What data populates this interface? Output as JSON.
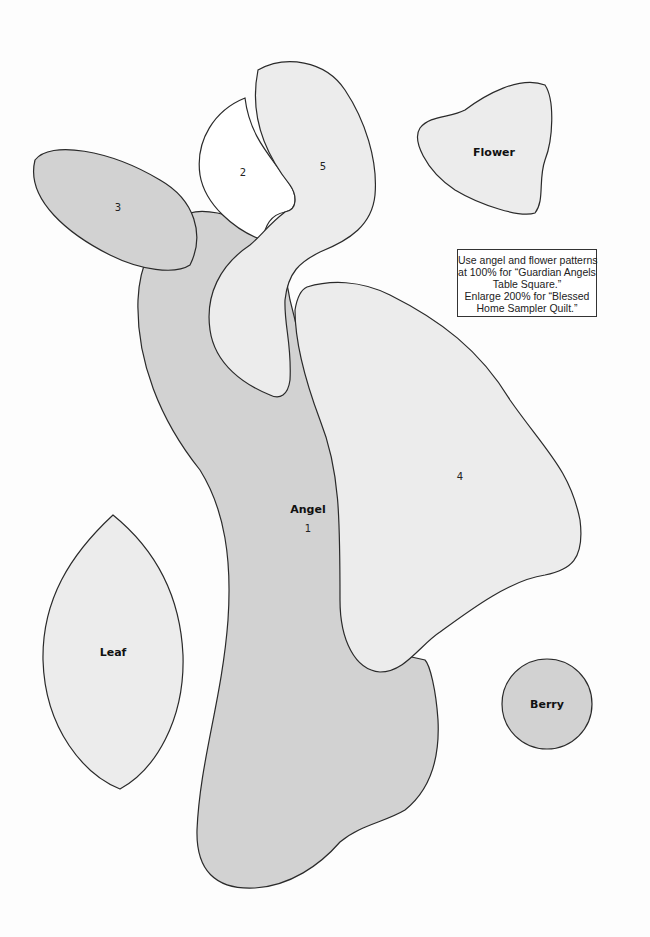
{
  "document": {
    "type": "quilt applique pattern sheet",
    "colors": {
      "background": "#fdfdfd",
      "dark_fill": "#d2d2d2",
      "light_fill": "#ececec",
      "white_fill": "#ffffff",
      "outline": "#2a2a2a"
    },
    "pieces": {
      "angel": {
        "label": "Angel",
        "number": "1"
      },
      "head": {
        "number": "2"
      },
      "wing_left": {
        "number": "3"
      },
      "wing_right": {
        "number": "4"
      },
      "hair": {
        "number": "5"
      },
      "flower": {
        "label": "Flower"
      },
      "leaf": {
        "label": "Leaf"
      },
      "berry": {
        "label": "Berry"
      }
    },
    "note": {
      "lines": [
        "Use angel and flower patterns",
        "at 100% for “Guardian Angels",
        "Table Square.”",
        "Enlarge 200% for “Blessed",
        "Home Sampler Quilt.”"
      ]
    }
  }
}
